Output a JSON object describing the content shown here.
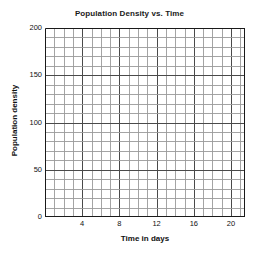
{
  "chart_data": {
    "type": "line",
    "title": "Population Density vs. Time",
    "xlabel": "Time in days",
    "ylabel": "Population density",
    "xlim": [
      0,
      21.5
    ],
    "ylim": [
      0,
      200
    ],
    "grid": true,
    "legend": null,
    "series": [],
    "x": [],
    "values": [],
    "annotations": [],
    "x_ticks_major": [
      4,
      8,
      12,
      16,
      20
    ],
    "x_tick_labels": [
      "4",
      "8",
      "12",
      "16",
      "20"
    ],
    "x_gridline_step": 1,
    "y_ticks_major": [
      0,
      50,
      100,
      150,
      200
    ],
    "y_tick_labels": [
      "0",
      "50",
      "100",
      "150",
      "200"
    ],
    "y_gridline_step": 10,
    "note": "Empty blank grid — no data plotted"
  },
  "style": {
    "background": "#ffffff",
    "grid_minor_color": "#9a9a9a",
    "grid_major_color": "#4a4a4a",
    "axis_color": "#1a1a1a",
    "text_color": "#111111"
  }
}
